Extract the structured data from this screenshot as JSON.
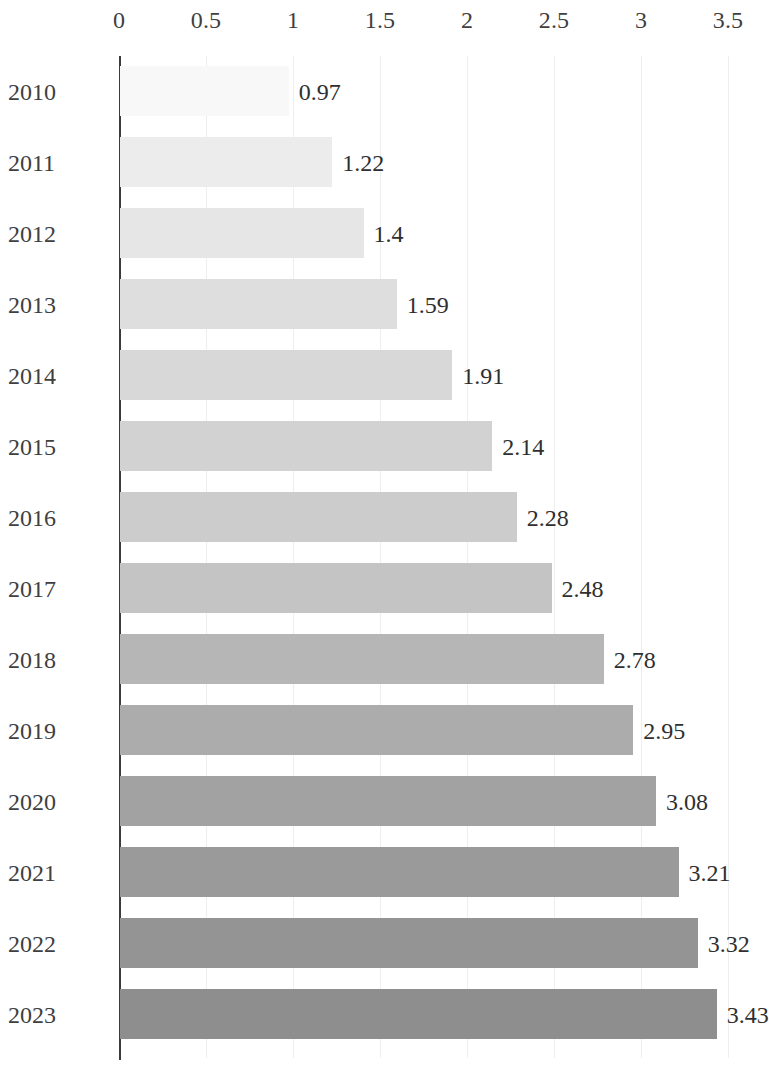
{
  "chart_data": {
    "type": "bar",
    "orientation": "horizontal",
    "title": "",
    "subtitle": "",
    "xlabel": "",
    "ylabel": "",
    "categories": [
      "2010",
      "2011",
      "2012",
      "2013",
      "2014",
      "2015",
      "2016",
      "2017",
      "2018",
      "2019",
      "2020",
      "2021",
      "2022",
      "2023"
    ],
    "values": [
      0.97,
      1.22,
      1.4,
      1.59,
      1.91,
      2.14,
      2.28,
      2.48,
      2.78,
      2.95,
      3.08,
      3.21,
      3.32,
      3.43
    ],
    "value_labels": [
      "0.97",
      "1.22",
      "1.4",
      "1.59",
      "1.91",
      "2.14",
      "2.28",
      "2.48",
      "2.78",
      "2.95",
      "3.08",
      "3.21",
      "3.32",
      "3.43"
    ],
    "bar_colors": [
      "#f8f8f8",
      "#ececec",
      "#e6e6e6",
      "#dedede",
      "#d8d8d8",
      "#d2d2d2",
      "#cccccc",
      "#c4c4c4",
      "#b6b6b6",
      "#acacac",
      "#a2a2a2",
      "#9a9a9a",
      "#949494",
      "#8e8e8e"
    ],
    "xlim": [
      0,
      3.5
    ],
    "xticks": [
      0,
      0.5,
      1,
      1.5,
      2,
      2.5,
      3,
      3.5
    ],
    "xtick_labels": [
      "0",
      "0.5",
      "1",
      "1.5",
      "2",
      "2.5",
      "3",
      "3.5"
    ],
    "grid": true,
    "grid_axis": "x",
    "grid_color": "#eeeeee",
    "axis_line_color": "#3a3a3a",
    "legend": false,
    "legend_position": "none",
    "axis_position": "top",
    "series": [
      {
        "name": "value",
        "values": [
          0.97,
          1.22,
          1.4,
          1.59,
          1.91,
          2.14,
          2.28,
          2.48,
          2.78,
          2.95,
          3.08,
          3.21,
          3.32,
          3.43
        ]
      }
    ]
  },
  "layout": {
    "plot_left_px": 119,
    "plot_right_px": 728,
    "row_pitch_px": 71,
    "bar_height_px": 50,
    "first_row_top_px": 8
  }
}
